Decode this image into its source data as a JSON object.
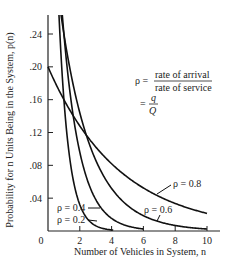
{
  "chart_data": {
    "type": "line",
    "title": "",
    "xlabel": "Number of Vehicles in System, n",
    "ylabel": "Probability for n Units Being in the System, p(n)",
    "xlim": [
      0,
      10
    ],
    "ylim": [
      0,
      0.26
    ],
    "x_ticks": [
      0,
      2,
      4,
      6,
      8,
      10
    ],
    "x_tick_labels": [
      "0",
      "2",
      "4",
      "6",
      "8",
      "10"
    ],
    "y_ticks": [
      0.04,
      0.08,
      0.12,
      0.16,
      0.2,
      0.24
    ],
    "y_tick_labels": [
      ".04",
      ".08",
      ".12",
      ".16",
      ".20",
      ".24"
    ],
    "grid": false,
    "formula": "p(n) = (1 - rho) * rho^n",
    "series": [
      {
        "name": "ρ = 0.2",
        "rho": 0.2,
        "x": [
          1,
          1.5,
          2,
          2.5,
          3,
          3.5,
          4
        ],
        "values": [
          0.16,
          0.072,
          0.032,
          0.014,
          0.006,
          0.003,
          0.001
        ]
      },
      {
        "name": "ρ = 0.4",
        "rho": 0.4,
        "x": [
          1,
          2,
          3,
          4,
          5,
          6
        ],
        "values": [
          0.24,
          0.096,
          0.038,
          0.015,
          0.006,
          0.002
        ]
      },
      {
        "name": "ρ = 0.6",
        "rho": 0.6,
        "x": [
          1,
          2,
          3,
          4,
          5,
          6,
          7,
          8,
          9,
          10
        ],
        "values": [
          0.24,
          0.144,
          0.086,
          0.052,
          0.031,
          0.019,
          0.011,
          0.007,
          0.004,
          0.002
        ]
      },
      {
        "name": "ρ = 0.8",
        "rho": 0.8,
        "x": [
          0,
          1,
          2,
          3,
          4,
          5,
          6,
          7,
          8,
          9,
          10
        ],
        "values": [
          0.2,
          0.16,
          0.128,
          0.102,
          0.082,
          0.066,
          0.052,
          0.042,
          0.034,
          0.027,
          0.021
        ]
      }
    ],
    "annotations": {
      "rho_def_lhs": "ρ =",
      "rho_def_num": "rate of arrival",
      "rho_def_den": "rate of service",
      "rho_eq2_lhs": "=",
      "rho_eq2_num": "q",
      "rho_eq2_den": "Q"
    },
    "curve_labels": {
      "r02": "ρ = 0.2",
      "r04": "ρ = 0.4",
      "r06": "ρ = 0.6",
      "r08": "ρ = 0.8"
    }
  }
}
